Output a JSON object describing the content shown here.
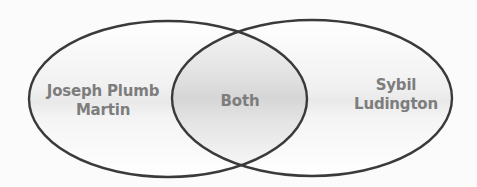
{
  "diagram": {
    "type": "venn",
    "sets": [
      {
        "id": "left",
        "label_lines": [
          "Joseph Plumb",
          "Martin"
        ]
      },
      {
        "id": "right",
        "label_lines": [
          "Sybil",
          "Ludington"
        ]
      }
    ],
    "intersection": {
      "label": "Both"
    }
  },
  "colors": {
    "outline": "#3a3a3a",
    "label_text": "#7d7d7d",
    "background": "#fbfbfb",
    "fill_light": "#ffffff",
    "fill_shade": "#d6d6d6"
  }
}
